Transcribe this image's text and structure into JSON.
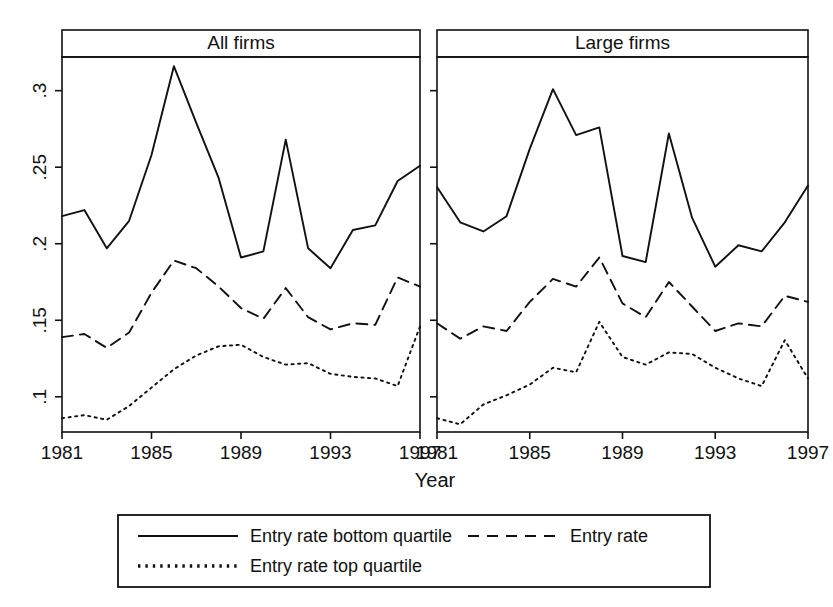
{
  "figure": {
    "x_axis_title": "Year",
    "panels": [
      {
        "key": "all",
        "title": "All firms"
      },
      {
        "key": "large",
        "title": "Large firms"
      }
    ],
    "y_ticks": [
      ".1",
      ".15",
      ".2",
      ".25",
      ".3"
    ],
    "x_ticks": [
      "1981",
      "1985",
      "1989",
      "1993",
      "1997"
    ],
    "legend": {
      "items": [
        {
          "label": "Entry rate bottom quartile",
          "style": "solid"
        },
        {
          "label": "Entry rate",
          "style": "dashed"
        },
        {
          "label": "Entry rate top quartile",
          "style": "dotted"
        }
      ]
    },
    "line_color": "#111111"
  },
  "chart_data": {
    "type": "line",
    "title": "",
    "xlabel": "Year",
    "ylabel": "",
    "xlim": [
      1981,
      1997
    ],
    "ylim": [
      0.077,
      0.322
    ],
    "ytick_values": [
      0.1,
      0.15,
      0.2,
      0.25,
      0.3
    ],
    "xtick_values": [
      1981,
      1985,
      1989,
      1993,
      1997
    ],
    "grid": false,
    "legend_position": "bottom",
    "x": [
      1981,
      1982,
      1983,
      1984,
      1985,
      1986,
      1987,
      1988,
      1989,
      1990,
      1991,
      1992,
      1993,
      1994,
      1995,
      1996,
      1997
    ],
    "panels": [
      {
        "name": "All firms",
        "series": [
          {
            "name": "Entry rate bottom quartile",
            "style": "solid",
            "values": [
              0.218,
              0.222,
              0.197,
              0.215,
              0.258,
              0.316,
              0.279,
              0.243,
              0.191,
              0.195,
              0.268,
              0.197,
              0.184,
              0.209,
              0.212,
              0.241,
              0.251
            ]
          },
          {
            "name": "Entry rate",
            "style": "dashed",
            "values": [
              0.139,
              0.141,
              0.132,
              0.142,
              0.168,
              0.189,
              0.184,
              0.172,
              0.158,
              0.151,
              0.171,
              0.152,
              0.144,
              0.148,
              0.147,
              0.178,
              0.172
            ]
          },
          {
            "name": "Entry rate top quartile",
            "style": "dotted",
            "values": [
              0.086,
              0.088,
              0.085,
              0.094,
              0.106,
              0.118,
              0.127,
              0.133,
              0.134,
              0.126,
              0.121,
              0.122,
              0.115,
              0.113,
              0.112,
              0.107,
              0.146
            ]
          }
        ]
      },
      {
        "name": "Large firms",
        "series": [
          {
            "name": "Entry rate bottom quartile",
            "style": "solid",
            "values": [
              0.237,
              0.214,
              0.208,
              0.218,
              0.262,
              0.301,
              0.271,
              0.276,
              0.192,
              0.188,
              0.272,
              0.217,
              0.185,
              0.199,
              0.195,
              0.214,
              0.238
            ]
          },
          {
            "name": "Entry rate",
            "style": "dashed",
            "values": [
              0.148,
              0.138,
              0.146,
              0.143,
              0.162,
              0.177,
              0.172,
              0.191,
              0.161,
              0.152,
              0.175,
              0.159,
              0.143,
              0.148,
              0.146,
              0.166,
              0.162
            ]
          },
          {
            "name": "Entry rate top quartile",
            "style": "dotted",
            "values": [
              0.086,
              0.082,
              0.095,
              0.101,
              0.108,
              0.119,
              0.116,
              0.149,
              0.126,
              0.121,
              0.129,
              0.128,
              0.119,
              0.112,
              0.107,
              0.137,
              0.112
            ]
          }
        ]
      }
    ]
  }
}
